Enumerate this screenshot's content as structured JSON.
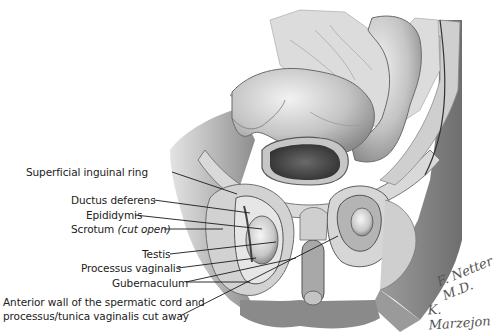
{
  "figure": {
    "type": "anatomical-illustration",
    "colors": {
      "background": "#ffffff",
      "text": "#222222",
      "leader_line": "#1a1a1a",
      "illustration_tone": "grayscale"
    }
  },
  "labels": [
    {
      "id": "superficial-inguinal-ring",
      "text": "Superficial inguinal ring"
    },
    {
      "id": "ductus-deferens",
      "text": "Ductus deferens"
    },
    {
      "id": "epididymis",
      "text": "Epididymis"
    },
    {
      "id": "scrotum",
      "text": "Scrotum",
      "italic_suffix": "(cut open)"
    },
    {
      "id": "testis",
      "text": "Testis"
    },
    {
      "id": "processus-vaginalis",
      "text": "Processus vaginalis"
    },
    {
      "id": "gubernaculum",
      "text": "Gubernaculum"
    },
    {
      "id": "anterior-wall",
      "line1": "Anterior wall of the spermatic cord and",
      "line2": "processus/tunica vaginalis cut away"
    }
  ],
  "signatures": {
    "artist1": "F. Netter M.D.",
    "artist2": "K. Marzejon"
  }
}
